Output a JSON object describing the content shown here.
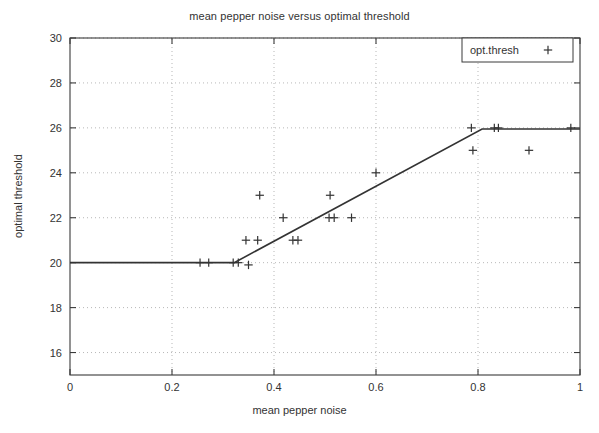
{
  "chart_data": {
    "type": "scatter",
    "title": "mean pepper noise versus optimal threshold",
    "xlabel": "mean pepper noise",
    "ylabel": "optimal threshold",
    "xlim": [
      0,
      1
    ],
    "ylim": [
      15,
      30
    ],
    "xticks": [
      "0",
      "0.2",
      "0.4",
      "0.6",
      "0.8",
      "1"
    ],
    "xtick_values": [
      0,
      0.2,
      0.4,
      0.6,
      0.8,
      1
    ],
    "yticks": [
      "16",
      "18",
      "20",
      "22",
      "24",
      "26",
      "28",
      "30"
    ],
    "ytick_values": [
      16,
      18,
      20,
      22,
      24,
      26,
      28,
      30
    ],
    "grid": true,
    "grid_style": "dotted",
    "legend": {
      "position": "top-right",
      "entries": [
        {
          "name": "opt.thresh",
          "marker": "+"
        }
      ]
    },
    "series": [
      {
        "name": "opt.thresh",
        "marker": "+",
        "marker_color": "#333333",
        "points": [
          {
            "x": 0.255,
            "y": 20
          },
          {
            "x": 0.272,
            "y": 20
          },
          {
            "x": 0.32,
            "y": 20
          },
          {
            "x": 0.33,
            "y": 20
          },
          {
            "x": 0.35,
            "y": 19.9
          },
          {
            "x": 0.345,
            "y": 21
          },
          {
            "x": 0.368,
            "y": 21
          },
          {
            "x": 0.372,
            "y": 23
          },
          {
            "x": 0.418,
            "y": 22
          },
          {
            "x": 0.437,
            "y": 21
          },
          {
            "x": 0.447,
            "y": 21
          },
          {
            "x": 0.51,
            "y": 23
          },
          {
            "x": 0.508,
            "y": 22
          },
          {
            "x": 0.518,
            "y": 22
          },
          {
            "x": 0.552,
            "y": 22
          },
          {
            "x": 0.6,
            "y": 24
          },
          {
            "x": 0.787,
            "y": 26
          },
          {
            "x": 0.79,
            "y": 25
          },
          {
            "x": 0.832,
            "y": 26
          },
          {
            "x": 0.84,
            "y": 26
          },
          {
            "x": 0.9,
            "y": 25
          },
          {
            "x": 0.982,
            "y": 26
          }
        ]
      },
      {
        "name": "fit-line",
        "type": "line",
        "line_color": "#333333",
        "points": [
          {
            "x": 0.0,
            "y": 20
          },
          {
            "x": 0.322,
            "y": 20
          },
          {
            "x": 0.808,
            "y": 25.95
          },
          {
            "x": 1.0,
            "y": 25.95
          }
        ]
      }
    ]
  }
}
